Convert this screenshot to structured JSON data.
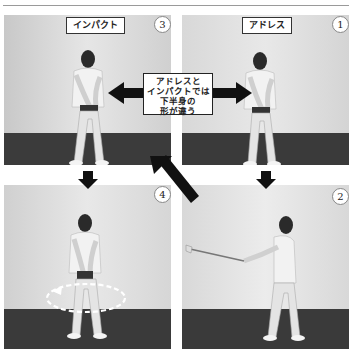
{
  "diagram": {
    "panels": [
      {
        "id": "impact",
        "number": "3",
        "label": "インパクト",
        "position": "top-left"
      },
      {
        "id": "address",
        "number": "1",
        "label": "アドレス",
        "position": "top-right"
      },
      {
        "id": "rotation",
        "number": "4",
        "label": "",
        "position": "bottom-left"
      },
      {
        "id": "swing",
        "number": "2",
        "label": "",
        "position": "bottom-right"
      }
    ],
    "callout": {
      "lines": [
        "アドレスと",
        "インパクトでは",
        "下半身の",
        "形が違う"
      ]
    },
    "arrows": [
      {
        "type": "double-horizontal",
        "between": [
          "3",
          "1"
        ]
      },
      {
        "type": "down",
        "from": "3",
        "to": "4"
      },
      {
        "type": "down",
        "from": "1",
        "to": "2"
      },
      {
        "type": "diagonal",
        "from": "2",
        "to": "3"
      }
    ],
    "colors": {
      "wall": "#d9d9d9",
      "floor": "#3a3a3a",
      "arrow": "#111111",
      "label_border": "#333333"
    }
  }
}
